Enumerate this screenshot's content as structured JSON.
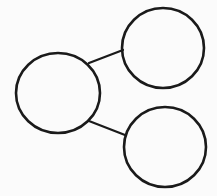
{
  "diagram": {
    "type": "number-bond",
    "background": "#fbfbfb",
    "stroke_color": "#1a1a1a",
    "nodes": [
      {
        "id": "whole",
        "label": "",
        "cx": 58,
        "cy": 93,
        "rx": 42,
        "ry": 40
      },
      {
        "id": "part-top",
        "label": "",
        "cx": 163,
        "cy": 48,
        "rx": 41,
        "ry": 40
      },
      {
        "id": "part-bottom",
        "label": "",
        "cx": 165,
        "cy": 147,
        "rx": 41,
        "ry": 40
      }
    ],
    "edges": [
      {
        "from": "whole",
        "to": "part-top"
      },
      {
        "from": "whole",
        "to": "part-bottom"
      }
    ]
  }
}
